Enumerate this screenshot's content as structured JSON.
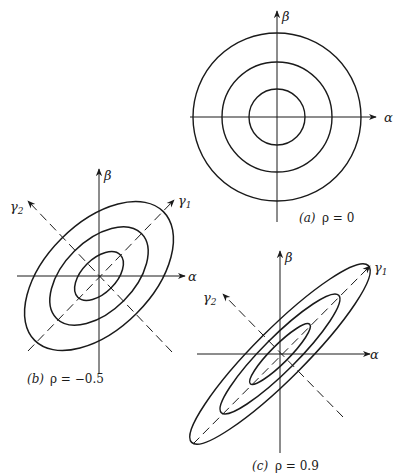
{
  "figure": {
    "panels": [
      {
        "id": "a",
        "caption_tag": "(a)",
        "caption_eq": "ρ = 0",
        "rho": 0,
        "axes": {
          "x_label": "α",
          "y_label": "β"
        },
        "contours": "concentric circles",
        "contour_count": 3
      },
      {
        "id": "b",
        "caption_tag": "(b)",
        "caption_eq": "ρ = −0.5",
        "rho": -0.5,
        "axes": {
          "x_label": "α",
          "y_label": "β",
          "principal_1": "γ",
          "principal_1_sub": "1",
          "principal_2": "γ",
          "principal_2_sub": "2"
        },
        "contours": "ellipses, major axis along γ2",
        "contour_count": 3
      },
      {
        "id": "c",
        "caption_tag": "(c)",
        "caption_eq": "ρ = 0.9",
        "rho": 0.9,
        "axes": {
          "x_label": "α",
          "y_label": "β",
          "principal_1": "γ",
          "principal_1_sub": "1",
          "principal_2": "γ",
          "principal_2_sub": "2"
        },
        "contours": "elongated ellipses, major axis along γ1",
        "contour_count": 3
      }
    ]
  }
}
